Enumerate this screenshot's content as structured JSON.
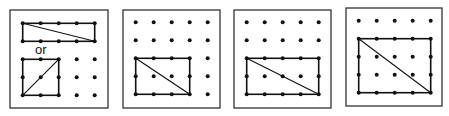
{
  "figure": {
    "spacing": 18,
    "panels": [
      {
        "id": "panel-1",
        "frame": [
          10,
          10,
          98,
          98
        ],
        "grid_origin": [
          22.7,
          23.3
        ],
        "dots": [
          [
            0,
            0
          ],
          [
            1,
            0
          ],
          [
            2,
            0
          ],
          [
            3,
            0
          ],
          [
            4,
            0
          ],
          [
            0,
            1
          ],
          [
            1,
            1
          ],
          [
            2,
            1
          ],
          [
            3,
            1
          ],
          [
            4,
            1
          ],
          [
            0,
            2
          ],
          [
            1,
            2
          ],
          [
            2,
            2
          ],
          [
            3,
            2
          ],
          [
            4,
            2
          ],
          [
            0,
            3
          ],
          [
            1,
            3
          ],
          [
            2,
            3
          ],
          [
            3,
            3
          ],
          [
            4,
            3
          ],
          [
            0,
            4
          ],
          [
            1,
            4
          ],
          [
            2,
            4
          ],
          [
            3,
            4
          ],
          [
            4,
            4
          ]
        ],
        "rects": [
          {
            "x0": 0,
            "y0": 0,
            "x1": 4,
            "y1": 1,
            "diag": "tl-br"
          },
          {
            "x0": 0,
            "y0": 2,
            "x1": 2,
            "y1": 4,
            "diag": "bl-tr"
          }
        ],
        "label": {
          "text": "or",
          "x": 35,
          "y": 54
        }
      },
      {
        "id": "panel-2",
        "frame": [
          123,
          10,
          97,
          98
        ],
        "grid_origin": [
          135.7,
          22.3
        ],
        "dots": "all",
        "rects": [
          {
            "x0": 0,
            "y0": 2,
            "x1": 3,
            "y1": 4,
            "diag": "tl-br"
          }
        ]
      },
      {
        "id": "panel-3",
        "frame": [
          234,
          10,
          97,
          98
        ],
        "grid_origin": [
          246.7,
          22.3
        ],
        "dots": "all",
        "rects": [
          {
            "x0": 0,
            "y0": 2,
            "x1": 4,
            "y1": 4,
            "diag": "tl-br"
          }
        ]
      },
      {
        "id": "panel-4",
        "frame": [
          346,
          8,
          96,
          98
        ],
        "grid_origin": [
          358.7,
          20.7
        ],
        "dots": "all",
        "rects": [
          {
            "x0": 0,
            "y0": 1,
            "x1": 4,
            "y1": 4,
            "diag": "tl-br"
          }
        ]
      }
    ]
  },
  "labels": {
    "or": "or"
  }
}
